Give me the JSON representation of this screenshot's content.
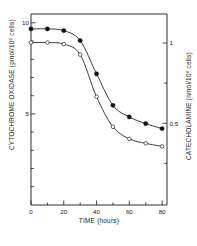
{
  "chart_data": {
    "type": "line",
    "title": "",
    "subtitle": "",
    "xlabel": "TIME (hours)",
    "ylabel": "CYTOCHROME OXIDASE (pmol/10",
    "ylabel_sup": "6",
    "ylabel_tail": " cells)",
    "y2label": "CATECHOLAMINE (nmol/10",
    "y2label_sup": "6",
    "y2label_tail": " cells)",
    "xlim": [
      0,
      83
    ],
    "ylim": [
      0,
      11.5
    ],
    "y2lim": [
      0,
      1.27
    ],
    "grid": false,
    "legend_position": "none",
    "x_ticks": [
      0,
      20,
      40,
      60,
      80
    ],
    "x_tick_labels": [
      "0",
      "20",
      "40",
      "60",
      "80"
    ],
    "x_minor_ticks": [
      10,
      30,
      50,
      70
    ],
    "y_ticks": [
      5,
      10
    ],
    "y_tick_labels": [
      "5",
      "10"
    ],
    "y_minor_ticks": [
      1,
      2,
      3,
      4,
      6,
      7,
      8,
      9,
      11
    ],
    "y2_ticks": [
      0.5,
      1
    ],
    "y2_tick_labels": [
      "0.5",
      "1"
    ],
    "y2_minor_ticks": [
      0.25,
      0.75
    ],
    "x": [
      0,
      10,
      20,
      30,
      40,
      50,
      60,
      70,
      80
    ],
    "series": [
      {
        "name": "Cytochrome oxidase",
        "marker": "filled-circle",
        "axis": "left",
        "values": [
          10.6,
          10.6,
          10.5,
          9.9,
          7.9,
          6.0,
          5.3,
          4.9,
          4.6
        ]
      },
      {
        "name": "Catecholamine",
        "marker": "open-circle",
        "axis": "right",
        "values": [
          1.08,
          1.08,
          1.07,
          1.0,
          0.72,
          0.52,
          0.44,
          0.41,
          0.39
        ]
      }
    ]
  },
  "axes": {
    "x_title": "TIME (hours)",
    "y_left_title_main": "CYTOCHROME OXIDASE (pmol/10",
    "y_left_title_sup": "6",
    "y_left_title_end": " cells)",
    "y_right_title_main": "CATECHOLAMINE (nmol/10",
    "y_right_title_sup": "6",
    "y_right_title_end": " cells)",
    "x_labels": {
      "t0": "0",
      "t20": "20",
      "t40": "40",
      "t60": "60",
      "t80": "80"
    },
    "y_labels": {
      "y5": "5",
      "y10": "10"
    },
    "y2_labels": {
      "v05": "0.5",
      "v1": "1"
    }
  }
}
